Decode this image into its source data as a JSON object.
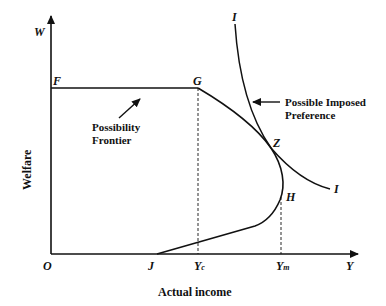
{
  "diagram": {
    "axes": {
      "y_axis_letter": "W",
      "x_axis_letter": "Y",
      "origin": "O",
      "y_axis_title": "Welfare",
      "x_axis_title": "Actual income"
    },
    "points": {
      "F": "F",
      "G": "G",
      "Z": "Z",
      "H": "H",
      "J": "J",
      "I_top": "I",
      "I_bottom": "I"
    },
    "x_ticks": {
      "yc_main": "Y",
      "yc_sub": "c",
      "ym_main": "Y",
      "ym_sub": "m"
    },
    "annotations": {
      "frontier_line1": "Possibility",
      "frontier_line2": "Frontier",
      "preference_line1": "Possible Imposed",
      "preference_line2": "Preference"
    },
    "colors": {
      "line": "#111111",
      "background": "#ffffff"
    }
  }
}
